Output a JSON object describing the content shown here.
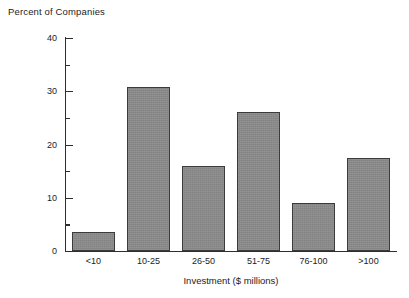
{
  "chart_data": {
    "type": "bar",
    "title": "Percent of Companies",
    "xlabel": "Investment ($ millions)",
    "ylabel": "",
    "categories": [
      "<10",
      "10-25",
      "26-50",
      "51-75",
      "76-100",
      ">100"
    ],
    "values": [
      3.6,
      30.8,
      16.0,
      26.1,
      9.0,
      17.4
    ],
    "ylim": [
      0,
      40
    ],
    "y_major_ticks": [
      0,
      10,
      20,
      30,
      40
    ],
    "y_major_tick_labels": [
      "0",
      "10",
      "20",
      "30",
      "40"
    ],
    "y_minor_ticks": [
      5,
      15,
      25,
      35
    ],
    "grid": false,
    "legend": "none",
    "colors": {
      "bar_fill": "#8a8a8a",
      "bar_border": "#3b3b3b",
      "axis": "#2e2e2e",
      "text": "#1c1c1c",
      "background": "#ffffff"
    }
  }
}
